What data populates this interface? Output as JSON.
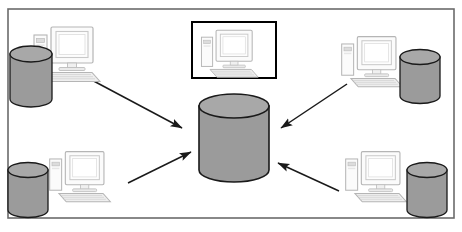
{
  "diagram": {
    "title": "Client workstations connecting to a central database",
    "canvas": {
      "width": 462,
      "height": 232,
      "background": "#ffffff"
    },
    "frame": {
      "name": "diagram-border",
      "x": 8,
      "y": 9,
      "width": 446,
      "height": 209,
      "stroke": "#6b6b6b",
      "stroke_width": 1.6,
      "fill": "#ffffff"
    },
    "colors": {
      "cylinder_body": "#9b9b9b",
      "cylinder_top": "#a8a8a8",
      "cylinder_outline": "#1a1a1a",
      "computer_outline": "#b5b5b5",
      "computer_fill": "#fbfbfb",
      "computer_shade": "#e4e4e4",
      "keyboard_fill": "#efefef",
      "arrow": "#1a1a1a",
      "selection_border": "#000000",
      "frame_border": "#6b6b6b"
    },
    "central_database": {
      "label": "central-database",
      "cx": 234,
      "cy": 138,
      "rx": 35,
      "body_top": 94,
      "body_bottom": 182,
      "ellipse_ry": 12
    },
    "selected_node": {
      "label": "highlighted-workstation",
      "x": 192,
      "y": 22,
      "width": 84,
      "height": 56,
      "border_width": 2
    },
    "nodes": [
      {
        "id": "workstation-top-left",
        "label": "Top-left workstation",
        "computer": {
          "x": 30,
          "y": 22,
          "scale": 1.0
        },
        "cylinder": {
          "cx": 31,
          "cy": 76,
          "rx": 21,
          "top": 54,
          "bottom": 99,
          "ry": 8
        },
        "cylinder_side": "left"
      },
      {
        "id": "workstation-top-right",
        "label": "Top-right workstation",
        "computer": {
          "x": 338,
          "y": 32,
          "scale": 0.92
        },
        "cylinder": {
          "cx": 420,
          "cy": 76,
          "rx": 20,
          "top": 57,
          "bottom": 96,
          "ry": 7.5
        },
        "cylinder_side": "right"
      },
      {
        "id": "workstation-bottom-left",
        "label": "Bottom-left workstation",
        "computer": {
          "x": 46,
          "y": 147,
          "scale": 0.92
        },
        "cylinder": {
          "cx": 28,
          "cy": 190,
          "rx": 20,
          "top": 170,
          "bottom": 210,
          "ry": 7.5
        },
        "cylinder_side": "left"
      },
      {
        "id": "workstation-bottom-right",
        "label": "Bottom-right workstation",
        "computer": {
          "x": 342,
          "y": 147,
          "scale": 0.92
        },
        "cylinder": {
          "cx": 427,
          "cy": 190,
          "rx": 20,
          "top": 170,
          "bottom": 210,
          "ry": 7.5
        },
        "cylinder_side": "right"
      },
      {
        "id": "workstation-top-center",
        "label": "Top-center highlighted workstation",
        "computer": {
          "x": 198,
          "y": 26,
          "scale": 0.86
        },
        "cylinder": null,
        "cylinder_side": "none"
      }
    ],
    "arrows": [
      {
        "id": "arrow-top-left-to-database",
        "from_node": "workstation-top-left",
        "to": "central-database",
        "x1": 88,
        "y1": 78,
        "x2": 182,
        "y2": 128,
        "direction": "down-right"
      },
      {
        "id": "arrow-top-right-to-database",
        "from_node": "workstation-top-right",
        "to": "central-database",
        "x1": 347,
        "y1": 84,
        "x2": 281,
        "y2": 128,
        "direction": "down-left"
      },
      {
        "id": "arrow-bottom-left-to-database",
        "from_node": "workstation-bottom-left",
        "to": "central-database",
        "x1": 128,
        "y1": 183,
        "x2": 191,
        "y2": 152,
        "direction": "up-right"
      },
      {
        "id": "arrow-bottom-right-to-database",
        "from_node": "workstation-bottom-right",
        "to": "central-database",
        "x1": 339,
        "y1": 191,
        "x2": 278,
        "y2": 163,
        "direction": "up-left"
      }
    ]
  }
}
